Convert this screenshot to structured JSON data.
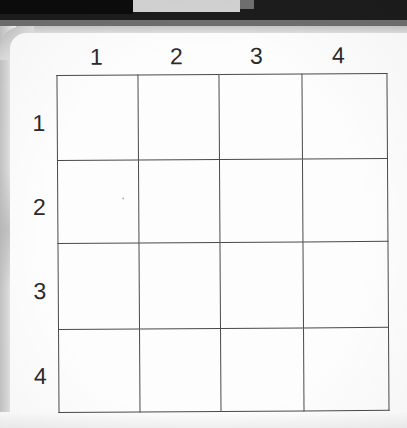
{
  "scene": {
    "width": 407,
    "height": 428,
    "description": "Photograph of a printed worksheet showing an empty 4-by-4 grid with numbered row and column headers"
  },
  "background": {
    "dark_band_color": "#1c1c1c",
    "gray_band_color": "#6e6e6e",
    "light_band_color": "#c9c9c9",
    "object_color": "#d2d2d2"
  },
  "paper": {
    "color": "#fdfdfd",
    "edge_color": "#cfcfcf"
  },
  "grid": {
    "rows": 4,
    "columns": 4,
    "line_color": "#4a4a4a",
    "column_headers": [
      "1",
      "2",
      "3",
      "4"
    ],
    "row_headers": [
      "1",
      "2",
      "3",
      "4"
    ],
    "cells": [
      [
        "",
        "",
        "",
        ""
      ],
      [
        "",
        "",
        "",
        ""
      ],
      [
        "",
        "",
        "",
        ""
      ],
      [
        "",
        "",
        "",
        ""
      ]
    ]
  },
  "marks": {
    "stray_dot_color": "#b2b2b2"
  }
}
